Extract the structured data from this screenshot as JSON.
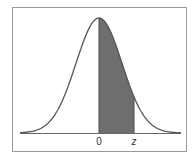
{
  "figure": {
    "frame_color": "#9a9a9a",
    "curve_color": "#555555",
    "shade_color": "#6e6e6e",
    "axis_color": "#666666",
    "labels": {
      "zero": "0",
      "z": "z"
    }
  },
  "chart_data": {
    "type": "area",
    "title": "",
    "xlabel": "",
    "ylabel": "",
    "distribution": "standard normal",
    "mean": 0,
    "shaded_region": {
      "from": "0",
      "to": "z"
    },
    "tick_labels": [
      "0",
      "z"
    ],
    "grid": false,
    "legend": false
  }
}
